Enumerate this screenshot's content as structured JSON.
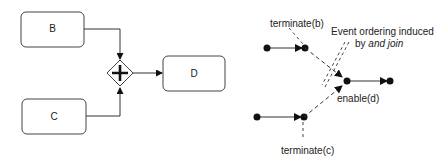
{
  "left_diagram": {
    "tasks": [
      {
        "id": "B",
        "label": "B"
      },
      {
        "id": "C",
        "label": "C"
      },
      {
        "id": "D",
        "label": "D"
      }
    ],
    "gateway": {
      "type": "parallel",
      "symbol": "+"
    }
  },
  "right_diagram": {
    "labels": {
      "terminate_b": "terminate(b)",
      "terminate_c": "terminate(c)",
      "enable_d": "enable(d)",
      "annotation_line1": "Event ordering induced",
      "annotation_line2_prefix": "by ",
      "annotation_line2_italic": "and join"
    }
  },
  "colors": {
    "stroke": "#333333",
    "fill": "#ffffff",
    "node": "#111111"
  }
}
